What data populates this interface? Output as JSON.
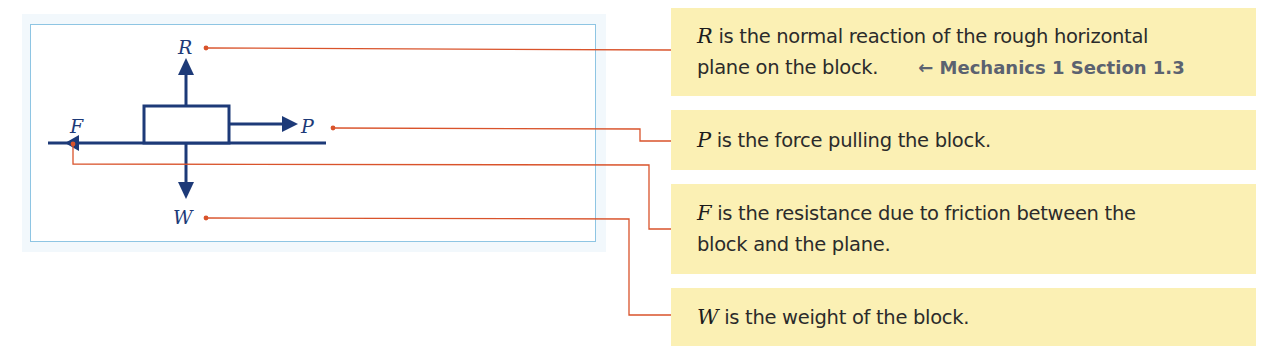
{
  "diagram": {
    "labels": {
      "R": "R",
      "P": "P",
      "F": "F",
      "W": "W"
    },
    "colors": {
      "force_arrows": "#1d3a78",
      "connector_lines": "#d9532b",
      "frame_border": "#8ec5e3",
      "note_background": "#fbf0b4",
      "reference_text": "#5b6270"
    }
  },
  "notes": [
    {
      "symbol": "R",
      "line1": " is the normal reaction of the rough horizontal",
      "line2": "plane on the block.",
      "reference": "← Mechanics 1 Section 1.3"
    },
    {
      "symbol": "P",
      "text": " is the force pulling the block."
    },
    {
      "symbol": "F",
      "line1": " is the resistance due to friction between the",
      "line2": "block and the plane."
    },
    {
      "symbol": "W",
      "text": " is the weight of the block."
    }
  ]
}
